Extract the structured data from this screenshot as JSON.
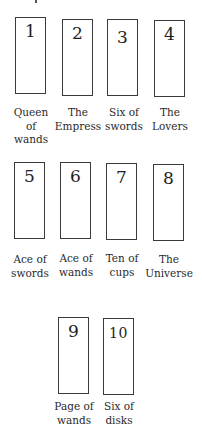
{
  "diagram": {
    "type": "tarot-spread",
    "rows": [
      {
        "cards": [
          {
            "number": "1",
            "label_lines": [
              "Queen",
              "of",
              "wands"
            ]
          },
          {
            "number": "2",
            "label_lines": [
              "The",
              "Empress"
            ]
          },
          {
            "number": "3",
            "label_lines": [
              "Six of",
              "swords"
            ]
          },
          {
            "number": "4",
            "label_lines": [
              "The",
              "Lovers"
            ]
          }
        ]
      },
      {
        "cards": [
          {
            "number": "5",
            "label_lines": [
              "Ace of",
              "swords"
            ]
          },
          {
            "number": "6",
            "label_lines": [
              "Ace of",
              "wands"
            ]
          },
          {
            "number": "7",
            "label_lines": [
              "Ten of",
              "cups"
            ]
          },
          {
            "number": "8",
            "label_lines": [
              "The",
              "Universe"
            ]
          }
        ]
      },
      {
        "cards": [
          {
            "number": "9",
            "label_lines": [
              "Page of",
              "wands"
            ]
          },
          {
            "number": "10",
            "label_lines": [
              "Six of",
              "disks"
            ]
          }
        ]
      }
    ]
  },
  "cards": {
    "c1": {
      "number": "1",
      "label": "Queen of wands",
      "l1": "Queen",
      "l2": "of",
      "l3": "wands"
    },
    "c2": {
      "number": "2",
      "label": "The Empress",
      "l1": "The",
      "l2": "Empress"
    },
    "c3": {
      "number": "3",
      "label": "Six of swords",
      "l1": "Six of",
      "l2": "swords"
    },
    "c4": {
      "number": "4",
      "label": "The Lovers",
      "l1": "The",
      "l2": "Lovers"
    },
    "c5": {
      "number": "5",
      "label": "Ace of swords",
      "l1": "Ace of",
      "l2": "swords"
    },
    "c6": {
      "number": "6",
      "label": "Ace of wands",
      "l1": "Ace of",
      "l2": "wands"
    },
    "c7": {
      "number": "7",
      "label": "Ten of cups",
      "l1": "Ten of",
      "l2": "cups"
    },
    "c8": {
      "number": "8",
      "label": "The Universe",
      "l1": "The",
      "l2": "Universe"
    },
    "c9": {
      "number": "9",
      "label": "Page of wands",
      "l1": "Page of",
      "l2": "wands"
    },
    "c10": {
      "number": "10",
      "label": "Six of disks",
      "l1": "Six of",
      "l2": "disks"
    }
  },
  "colors": {
    "card_border": "#3a3a3a",
    "text": "#222222",
    "background": "#ffffff"
  }
}
